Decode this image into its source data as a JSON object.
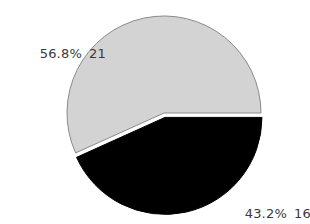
{
  "chart_data": {
    "type": "pie",
    "title": "",
    "slices": [
      {
        "label": "",
        "value": 21,
        "percent": "56.8%",
        "color": "#d3d3d3",
        "exploded": false
      },
      {
        "label": "",
        "value": 16,
        "percent": "43.2%",
        "color": "#000000",
        "exploded": true
      }
    ],
    "values": [
      21,
      16
    ],
    "percentages": [
      56.8,
      43.2
    ],
    "start_angle": "3 o'clock, clockwise for dark slice",
    "legend": null
  },
  "labels": {
    "slice_1_percent": "56.8%",
    "slice_1_count": "21",
    "slice_2_percent": "43.2%",
    "slice_2_count": "16"
  }
}
